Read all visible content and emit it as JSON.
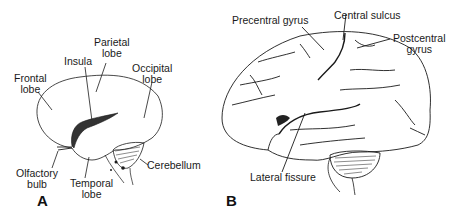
{
  "figure": {
    "panel_a": {
      "letter": "A",
      "labels": {
        "frontal": "Frontal\nlobe",
        "insula": "Insula",
        "parietal": "Parietal\nlobe",
        "occipital": "Occipital\nlobe",
        "olfactory": "Olfactory\nbulb",
        "temporal": "Temporal\nlobe",
        "cerebellum": "Cerebellum"
      }
    },
    "panel_b": {
      "letter": "B",
      "labels": {
        "precentral": "Precentral gyrus",
        "central_sulcus": "Central sulcus",
        "postcentral": "Postcentral\ngyrus",
        "lateral_fissure": "Lateral fissure"
      }
    },
    "colors": {
      "line": "#1a1a1a",
      "background": "#ffffff"
    }
  }
}
